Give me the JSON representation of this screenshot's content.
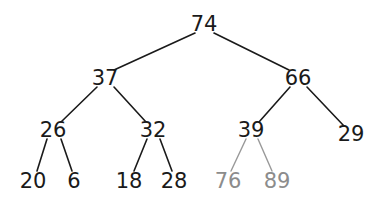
{
  "figure": {
    "width": 390,
    "height": 208,
    "background_color": "#ffffff",
    "node_color": "#1a1a1a",
    "faded_node_color": "#8c8c8c",
    "edge_color": "#1a1a1a",
    "faded_edge_color": "#999999"
  },
  "chart_data": {
    "type": "diagram",
    "title": "",
    "nodes": [
      {
        "id": "n74",
        "label": "74",
        "x": 204,
        "y": 24,
        "level": 0,
        "color": "#1a1a1a",
        "faded": false
      },
      {
        "id": "n37",
        "label": "37",
        "x": 105,
        "y": 78,
        "level": 1,
        "color": "#1a1a1a",
        "faded": false
      },
      {
        "id": "n66",
        "label": "66",
        "x": 298,
        "y": 78,
        "level": 1,
        "color": "#1a1a1a",
        "faded": false
      },
      {
        "id": "n26",
        "label": "26",
        "x": 53,
        "y": 130,
        "level": 2,
        "color": "#1a1a1a",
        "faded": false
      },
      {
        "id": "n32",
        "label": "32",
        "x": 153,
        "y": 130,
        "level": 2,
        "color": "#1a1a1a",
        "faded": false
      },
      {
        "id": "n39",
        "label": "39",
        "x": 251,
        "y": 130,
        "level": 2,
        "color": "#1a1a1a",
        "faded": false
      },
      {
        "id": "n29",
        "label": "29",
        "x": 351,
        "y": 134,
        "level": 2,
        "color": "#1a1a1a",
        "faded": false
      },
      {
        "id": "n20",
        "label": "20",
        "x": 33,
        "y": 181,
        "level": 3,
        "color": "#1a1a1a",
        "faded": false
      },
      {
        "id": "n6",
        "label": "6",
        "x": 74,
        "y": 181,
        "level": 3,
        "color": "#1a1a1a",
        "faded": false
      },
      {
        "id": "n18",
        "label": "18",
        "x": 129,
        "y": 181,
        "level": 3,
        "color": "#1a1a1a",
        "faded": false
      },
      {
        "id": "n28",
        "label": "28",
        "x": 174,
        "y": 181,
        "level": 3,
        "color": "#1a1a1a",
        "faded": false
      },
      {
        "id": "n76",
        "label": "76",
        "x": 228,
        "y": 181,
        "level": 3,
        "color": "#8c8c8c",
        "faded": true
      },
      {
        "id": "n89",
        "label": "89",
        "x": 277,
        "y": 181,
        "level": 3,
        "color": "#8c8c8c",
        "faded": true
      }
    ],
    "edges": [
      {
        "from": "n74",
        "to": "n37",
        "x1": 195,
        "y1": 33,
        "x2": 114,
        "y2": 70,
        "color": "#1a1a1a",
        "width": 1.6
      },
      {
        "from": "n74",
        "to": "n66",
        "x1": 214,
        "y1": 33,
        "x2": 289,
        "y2": 70,
        "color": "#1a1a1a",
        "width": 1.6
      },
      {
        "from": "n37",
        "to": "n26",
        "x1": 97,
        "y1": 87,
        "x2": 61,
        "y2": 122,
        "color": "#1a1a1a",
        "width": 1.6
      },
      {
        "from": "n37",
        "to": "n32",
        "x1": 114,
        "y1": 87,
        "x2": 146,
        "y2": 122,
        "color": "#1a1a1a",
        "width": 1.6
      },
      {
        "from": "n66",
        "to": "n39",
        "x1": 290,
        "y1": 87,
        "x2": 259,
        "y2": 122,
        "color": "#1a1a1a",
        "width": 1.6
      },
      {
        "from": "n66",
        "to": "n29",
        "x1": 307,
        "y1": 87,
        "x2": 344,
        "y2": 126,
        "color": "#1a1a1a",
        "width": 1.6
      },
      {
        "from": "n26",
        "to": "n20",
        "x1": 47,
        "y1": 139,
        "x2": 37,
        "y2": 171,
        "color": "#1a1a1a",
        "width": 1.6
      },
      {
        "from": "n26",
        "to": "n6",
        "x1": 61,
        "y1": 139,
        "x2": 72,
        "y2": 171,
        "color": "#1a1a1a",
        "width": 1.6
      },
      {
        "from": "n32",
        "to": "n18",
        "x1": 147,
        "y1": 139,
        "x2": 134,
        "y2": 171,
        "color": "#1a1a1a",
        "width": 1.6
      },
      {
        "from": "n32",
        "to": "n28",
        "x1": 160,
        "y1": 139,
        "x2": 172,
        "y2": 171,
        "color": "#1a1a1a",
        "width": 1.6
      },
      {
        "from": "n39",
        "to": "n76",
        "x1": 246,
        "y1": 139,
        "x2": 231,
        "y2": 171,
        "color": "#999999",
        "width": 1.4
      },
      {
        "from": "n39",
        "to": "n89",
        "x1": 258,
        "y1": 139,
        "x2": 272,
        "y2": 171,
        "color": "#999999",
        "width": 1.4
      }
    ]
  }
}
